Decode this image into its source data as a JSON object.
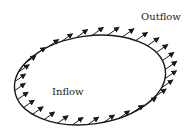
{
  "diagram": {
    "labels": {
      "outflow": "Outflow",
      "inflow": "Inflow"
    },
    "contour": {
      "shape": "ellipse",
      "cx": 90,
      "cy": 80,
      "rx": 76,
      "ry": 44,
      "rotation_deg": -8,
      "stroke": "#1a1a1a"
    },
    "flow": {
      "direction_deg": 35,
      "arrow_length": 14,
      "arrow_count": 30,
      "arrow_color": "#1a1a1a",
      "description": "Uniform flow vectors crossing a closed surface; inflow on lower-left, outflow on upper-right"
    }
  }
}
